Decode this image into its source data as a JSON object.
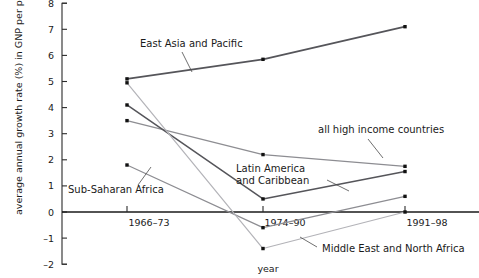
{
  "chart_data": {
    "type": "line",
    "title": "",
    "xlabel": "year",
    "ylabel": "average annual growth rate (%) in GNP per person",
    "categories": [
      "1966–73",
      "1974–90",
      "1991–98"
    ],
    "ylim": [
      -2,
      8
    ],
    "yticks": [
      -2,
      -1,
      0,
      1,
      2,
      3,
      4,
      5,
      6,
      7,
      8
    ],
    "ytick_labels": [
      "–2",
      "–1",
      "0",
      "1",
      "2",
      "3",
      "4",
      "5",
      "6",
      "7",
      "8"
    ],
    "grid": false,
    "legend": "inline-annotations",
    "zero_line": 0,
    "series": [
      {
        "name": "East Asia and Pacific",
        "values": [
          5.1,
          5.85,
          7.1
        ],
        "color": "#55555a",
        "width": 1.7
      },
      {
        "name": "all high income countries",
        "values": [
          3.5,
          2.2,
          1.75
        ],
        "color": "#8d8d92",
        "width": 1.2
      },
      {
        "name": "Latin America and Caribbean",
        "values": [
          4.1,
          0.5,
          1.55
        ],
        "color": "#55555a",
        "width": 1.5
      },
      {
        "name": "Sub-Saharan Africa",
        "values": [
          1.8,
          -0.6,
          0.6
        ],
        "color": "#8d8d92",
        "width": 1.2
      },
      {
        "name": "Middle East and North Africa",
        "values": [
          4.95,
          -1.4,
          0.0
        ],
        "color": "#b3b3b8",
        "width": 1.2
      }
    ],
    "annotations": [
      {
        "label": "East Asia and Pacific",
        "text_x": 140,
        "text_y": 47,
        "leader": "M182,52 L192,72"
      },
      {
        "label": "all high income countries",
        "text_x": 318,
        "text_y": 133,
        "leader": "M368,139 L383,158"
      },
      {
        "label": "Latin America",
        "text_x": 236,
        "text_y": 172,
        "leader": "M327,180 L349,191"
      },
      {
        "label": "and Caribbean",
        "text_x": 236,
        "text_y": 184,
        "leader": ""
      },
      {
        "label": "Sub-Saharan Africa",
        "text_x": 68,
        "text_y": 193,
        "leader": "M138,185 L151,167"
      },
      {
        "label": "Middle East and North Africa",
        "text_x": 322,
        "text_y": 252,
        "leader": "M317,247 L300,237"
      }
    ]
  },
  "axes": {
    "x_category_positions": [
      127,
      263,
      405
    ],
    "x_axis_start": 62,
    "x_axis_end": 479,
    "y_pixel_zero": 212,
    "y_pixel_per_unit": 26.1
  }
}
